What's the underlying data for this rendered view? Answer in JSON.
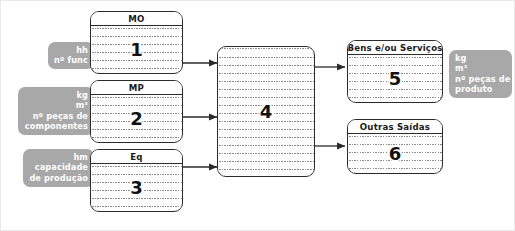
{
  "diagram": {
    "frame_color": "#e9e9e9",
    "chip_color": "#a8a8a8",
    "box_border_color": "#2b2b2b",
    "rule_color": "#8a8a8a"
  },
  "input_chips": [
    {
      "id": "chip-mo",
      "lines": [
        "hh",
        "nº func"
      ]
    },
    {
      "id": "chip-mp",
      "lines": [
        "kg",
        "m³",
        "nº peças de",
        "componentes"
      ]
    },
    {
      "id": "chip-eq",
      "lines": [
        "hm",
        "capacidade",
        "de produção"
      ]
    }
  ],
  "output_chips": [
    {
      "id": "chip-saida",
      "lines": [
        "kg",
        "m³",
        "nº peças de",
        "produto"
      ]
    }
  ],
  "boxes": [
    {
      "id": "box-mo",
      "header": "MO",
      "number": "1"
    },
    {
      "id": "box-mp",
      "header": "MP",
      "number": "2"
    },
    {
      "id": "box-eq",
      "header": "Eq",
      "number": "3"
    },
    {
      "id": "box-proc",
      "header": "",
      "number": "4"
    },
    {
      "id": "box-bens",
      "header": "Bens e/ou Serviços",
      "number": "5"
    },
    {
      "id": "box-outras",
      "header": "Outras Saídas",
      "number": "6"
    }
  ]
}
